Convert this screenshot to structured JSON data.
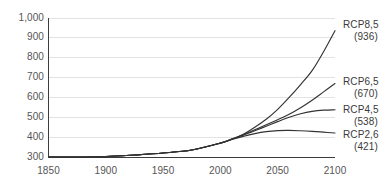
{
  "chart_data": {
    "type": "line",
    "title": "",
    "subtitle": "",
    "xlabel": "",
    "ylabel": "",
    "xlim": [
      1850,
      2100
    ],
    "ylim": [
      300,
      1000
    ],
    "grid": true,
    "grid_axis": "y",
    "legend_position": "right-inline",
    "x_ticks": [
      "1850",
      "1900",
      "1950",
      "2000",
      "2050",
      "2100"
    ],
    "x_tick_values": [
      1850,
      1900,
      1950,
      2000,
      2050,
      2100
    ],
    "y_ticks": [
      "300",
      "400",
      "500",
      "600",
      "700",
      "800",
      "900",
      "1,000"
    ],
    "y_tick_values": [
      300,
      400,
      500,
      600,
      700,
      800,
      900,
      1000
    ],
    "x": [
      1850,
      1875,
      1900,
      1925,
      1950,
      1975,
      2000,
      2010,
      2020,
      2030,
      2040,
      2050,
      2060,
      2070,
      2080,
      2090,
      2100
    ],
    "series": [
      {
        "name": "RCP8,5",
        "end_value": 936,
        "label": "RCP8,5",
        "value_label": "(936)",
        "color": "#333333",
        "values": [
          300,
          300,
          302,
          310,
          320,
          335,
          370,
          390,
          415,
          450,
          490,
          540,
          600,
          665,
          735,
          830,
          936
        ]
      },
      {
        "name": "RCP6,5",
        "end_value": 670,
        "label": "RCP6,5",
        "value_label": "(670)",
        "color": "#333333",
        "values": [
          300,
          300,
          302,
          310,
          320,
          335,
          370,
          390,
          412,
          437,
          462,
          488,
          515,
          548,
          586,
          628,
          670
        ]
      },
      {
        "name": "RCP4,5",
        "end_value": 538,
        "label": "RCP4,5",
        "value_label": "(538)",
        "color": "#333333",
        "values": [
          300,
          300,
          302,
          310,
          320,
          335,
          370,
          390,
          410,
          432,
          455,
          478,
          500,
          518,
          530,
          536,
          538
        ]
      },
      {
        "name": "RCP2,6",
        "end_value": 421,
        "label": "RCP2,6",
        "value_label": "(421)",
        "color": "#333333",
        "values": [
          300,
          300,
          302,
          310,
          320,
          335,
          370,
          388,
          404,
          418,
          428,
          433,
          434,
          432,
          429,
          425,
          421
        ]
      }
    ],
    "axis_color": "#3c3c3c",
    "grid_color": "#e3e3e3",
    "tick_label_color": "#555555"
  }
}
